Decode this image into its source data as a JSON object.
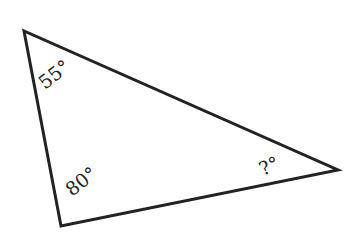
{
  "diagram": {
    "type": "triangle",
    "stroke_color": "#222222",
    "vertices": {
      "top_left": {
        "x": 24,
        "y": 31
      },
      "bottom_left": {
        "x": 61,
        "y": 226
      },
      "right": {
        "x": 338,
        "y": 170
      }
    },
    "angles": {
      "top_left": "55°",
      "bottom_left": "80°",
      "right": "?°"
    }
  }
}
